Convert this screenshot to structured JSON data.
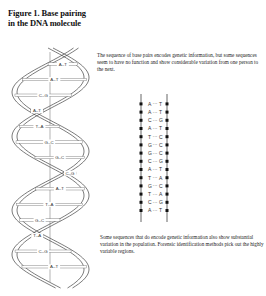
{
  "figure": {
    "title": "Figure 1.  Base pairing\nin the DNA molecule",
    "caption_top": "The sequence of base pairs encodes genetic information, but some sequences seem to have no function and show considerable variation from one person to the next.",
    "caption_bottom": "Some sequences that do encode genetic information also show substantial variation in the population.  Forensic identification methods pick out the highly variable regions."
  },
  "helix": {
    "pairs": [
      "A–T",
      "A–T",
      "C–G",
      "A–T",
      "T–A",
      "G–C",
      "G–C",
      "C–G",
      "A–T",
      "T–A",
      "G–C",
      "T–A",
      "C–G",
      "A–T"
    ]
  },
  "ladder": {
    "pairs": [
      {
        "left": "A",
        "right": "T"
      },
      {
        "left": "A",
        "right": "T"
      },
      {
        "left": "C",
        "right": "G"
      },
      {
        "left": "A",
        "right": "T"
      },
      {
        "left": "T",
        "right": "C"
      },
      {
        "left": "G",
        "right": "C"
      },
      {
        "left": "G",
        "right": "C"
      },
      {
        "left": "C",
        "right": "G"
      },
      {
        "left": "A",
        "right": "T"
      },
      {
        "left": "T",
        "right": "A"
      },
      {
        "left": "G",
        "right": "C"
      },
      {
        "left": "T",
        "right": "A"
      },
      {
        "left": "C",
        "right": "G"
      },
      {
        "left": "A",
        "right": "T"
      }
    ]
  }
}
